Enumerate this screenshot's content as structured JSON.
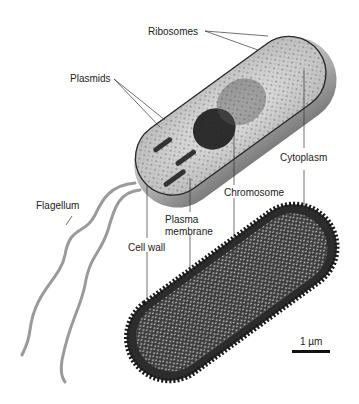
{
  "diagram": {
    "labels": {
      "ribosomes": "Ribosomes",
      "plasmids": "Plasmids",
      "cytoplasm": "Cytoplasm",
      "chromosome": "Chromosome",
      "flagellum": "Flagellum",
      "plasma_membrane_line1": "Plasma",
      "plasma_membrane_line2": "membrane",
      "cell_wall": "Cell wall"
    },
    "scale_bar": {
      "label": "1 µm"
    },
    "panels": [
      {
        "name": "illustration",
        "description": "Cutaway drawing of rod-shaped bacterium with flagella"
      },
      {
        "name": "micrograph",
        "description": "Electron micrograph of bacterium"
      }
    ]
  }
}
